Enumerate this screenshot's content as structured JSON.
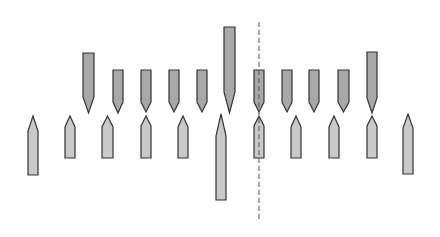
{
  "diagram": {
    "width": 440,
    "height": 237,
    "colors": {
      "background": "#ffffff",
      "top_fill": "#a8a8a8",
      "bottom_fill": "#c9c9c9",
      "stroke": "#333333",
      "dashed_line": "#555555"
    },
    "dashed_line": {
      "x": 259,
      "y1": 22,
      "y2": 222
    },
    "top_bars": [
      {
        "x": 83,
        "w": 11,
        "top": 53,
        "shoulder": 97,
        "tip": 113
      },
      {
        "x": 113,
        "w": 10,
        "top": 70,
        "shoulder": 102,
        "tip": 113
      },
      {
        "x": 141,
        "w": 10,
        "top": 70,
        "shoulder": 102,
        "tip": 112
      },
      {
        "x": 169,
        "w": 10,
        "top": 70,
        "shoulder": 102,
        "tip": 112
      },
      {
        "x": 197,
        "w": 10,
        "top": 70,
        "shoulder": 102,
        "tip": 112
      },
      {
        "x": 224,
        "w": 11,
        "top": 27,
        "shoulder": 92,
        "tip": 113
      },
      {
        "x": 254,
        "w": 10,
        "top": 70,
        "shoulder": 102,
        "tip": 112
      },
      {
        "x": 282,
        "w": 10,
        "top": 70,
        "shoulder": 102,
        "tip": 112
      },
      {
        "x": 309,
        "w": 10,
        "top": 70,
        "shoulder": 102,
        "tip": 112
      },
      {
        "x": 338,
        "w": 11,
        "top": 70,
        "shoulder": 102,
        "tip": 112
      },
      {
        "x": 367,
        "w": 10,
        "top": 52,
        "shoulder": 98,
        "tip": 113
      }
    ],
    "bottom_bars": [
      {
        "x": 28,
        "w": 10,
        "tip": 116,
        "shoulder": 131,
        "bottom": 175
      },
      {
        "x": 65,
        "w": 10,
        "tip": 116,
        "shoulder": 127,
        "bottom": 158
      },
      {
        "x": 102,
        "w": 11,
        "tip": 116,
        "shoulder": 127,
        "bottom": 158
      },
      {
        "x": 141,
        "w": 10,
        "tip": 116,
        "shoulder": 126,
        "bottom": 158
      },
      {
        "x": 178,
        "w": 10,
        "tip": 116,
        "shoulder": 127,
        "bottom": 158
      },
      {
        "x": 216,
        "w": 10,
        "tip": 114,
        "shoulder": 136,
        "bottom": 200
      },
      {
        "x": 254,
        "w": 10,
        "tip": 116,
        "shoulder": 126,
        "bottom": 158
      },
      {
        "x": 291,
        "w": 10,
        "tip": 116,
        "shoulder": 127,
        "bottom": 158
      },
      {
        "x": 329,
        "w": 10,
        "tip": 116,
        "shoulder": 127,
        "bottom": 158
      },
      {
        "x": 367,
        "w": 10,
        "tip": 116,
        "shoulder": 126,
        "bottom": 158
      },
      {
        "x": 403,
        "w": 10,
        "tip": 114,
        "shoulder": 128,
        "bottom": 174
      }
    ]
  }
}
